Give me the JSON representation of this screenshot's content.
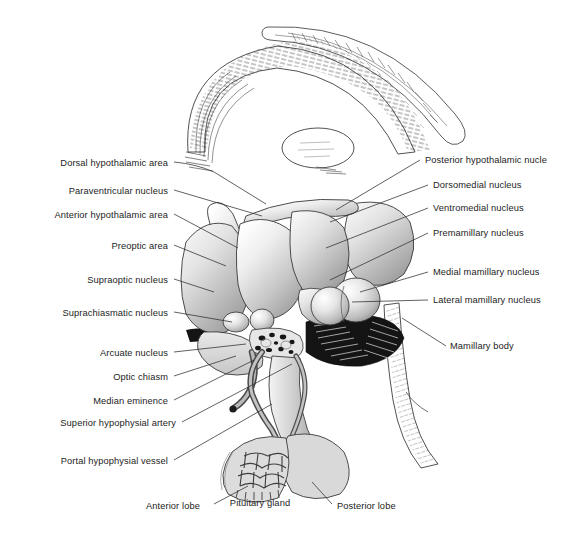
{
  "figure": {
    "background_color": "#ffffff",
    "ink_color": "#1d1d1d",
    "tissue_fill": "#d8d8d8",
    "tissue_light": "#f2f2f2",
    "tissue_shadow": "#9a9a9a",
    "dark_fill": "#111111"
  },
  "labels_left": [
    {
      "id": "dorsal-hypothalamic-area",
      "text": "Dorsal hypothalamic area",
      "x": 168,
      "y": 165
    },
    {
      "id": "paraventricular-nucleus",
      "text": "Paraventricular nucleus",
      "x": 168,
      "y": 193
    },
    {
      "id": "anterior-hypothalamic-area",
      "text": "Anterior hypothalamic area",
      "x": 168,
      "y": 217
    },
    {
      "id": "preoptic-area",
      "text": "Preoptic area",
      "x": 168,
      "y": 248
    },
    {
      "id": "supraoptic-nucleus",
      "text": "Supraoptic nucleus",
      "x": 168,
      "y": 282
    },
    {
      "id": "suprachiasmatic-nucleus",
      "text": "Suprachiasmatic nucleus",
      "x": 168,
      "y": 315
    },
    {
      "id": "arcuate-nucleus",
      "text": "Arcuate nucleus",
      "x": 168,
      "y": 355
    },
    {
      "id": "optic-chiasm",
      "text": "Optic chiasm",
      "x": 168,
      "y": 379
    },
    {
      "id": "median-eminence",
      "text": "Median eminence",
      "x": 168,
      "y": 403
    },
    {
      "id": "superior-hypophysial-artery",
      "text": "Superior hypophysial artery",
      "x": 168,
      "y": 425
    },
    {
      "id": "portal-hypophysial-vessel",
      "text": "Portal hypophysial vessel",
      "x": 168,
      "y": 463
    }
  ],
  "labels_right": [
    {
      "id": "posterior-hypothalamic-nucleus",
      "text": "Posterior hypothalamic nucle",
      "x": 425,
      "y": 162
    },
    {
      "id": "dorsomedial-nucleus",
      "text": "Dorsomedial nucleus",
      "x": 433,
      "y": 187
    },
    {
      "id": "ventromedial-nucleus",
      "text": "Ventromedial nucleus",
      "x": 433,
      "y": 210
    },
    {
      "id": "premamillary-nucleus",
      "text": "Premamillary nucleus",
      "x": 433,
      "y": 235
    },
    {
      "id": "medial-mamillary-nucleus",
      "text": "Medial mamillary nucleus",
      "x": 433,
      "y": 274
    },
    {
      "id": "lateral-mamillary-nucleus",
      "text": "Lateral mamillary nucleus",
      "x": 433,
      "y": 302
    },
    {
      "id": "mamillary-body",
      "text": "Mamillary body",
      "x": 450,
      "y": 348
    }
  ],
  "labels_bottom": [
    {
      "id": "anterior-lobe",
      "text": "Anterior lobe",
      "x": 146,
      "y": 507,
      "align": "left"
    },
    {
      "id": "pituitary-gland",
      "text": "Pituitary\ngland",
      "x": 259,
      "y": 504,
      "align": "center"
    },
    {
      "id": "posterior-lobe",
      "text": "Posterior lobe",
      "x": 337,
      "y": 507,
      "align": "left"
    }
  ],
  "structures": [
    "corpus-callosum",
    "thalamus",
    "fornix",
    "paraventricular-nucleus-lobe",
    "preoptic-lobe",
    "anterior-hypothalamic-lobe",
    "dorsomedial-lobe",
    "ventromedial-lobe",
    "posterior-hypothalamic-lobe",
    "premamillary-lobe",
    "suprachiasmatic-lobe",
    "arcuate-lobe",
    "mamillary-body",
    "optic-chiasm",
    "median-eminence",
    "infundibular-stalk",
    "anterior-pituitary-lobe",
    "posterior-pituitary-lobe",
    "portal-vessel-plexus",
    "superior-hypophysial-artery",
    "brainstem-band"
  ]
}
